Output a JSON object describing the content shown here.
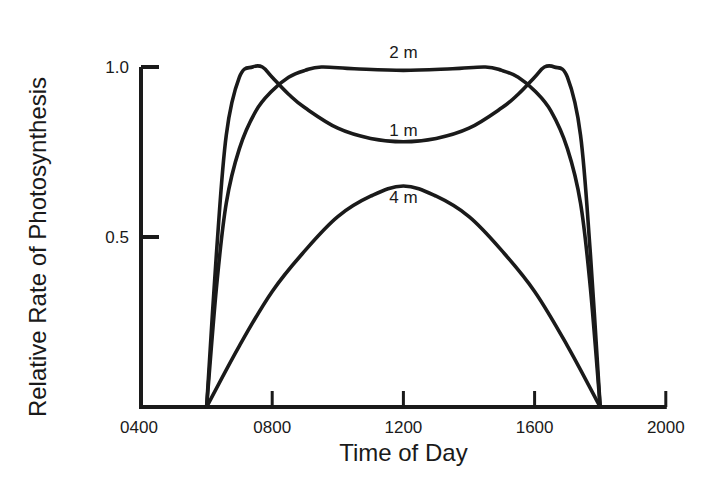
{
  "chart_data": {
    "type": "line",
    "title": "",
    "xlabel": "Time of Day",
    "ylabel": "Relative Rate of Photosynthesis",
    "x_tick_labels": [
      "0400",
      "0800",
      "1200",
      "1600",
      "2000"
    ],
    "x_ticks_hours": [
      4,
      8,
      12,
      16,
      20
    ],
    "y_tick_labels": [
      "0.5",
      "1.0"
    ],
    "y_ticks": [
      0.5,
      1.0
    ],
    "xlim_hours": [
      4,
      20
    ],
    "ylim": [
      0,
      1.0
    ],
    "grid": false,
    "legend": "inline labels on curves",
    "series": [
      {
        "name": "1 m",
        "label": "1 m",
        "x_hours": [
          6.0,
          6.3,
          6.6,
          7.0,
          7.4,
          7.7,
          8.0,
          8.5,
          9.0,
          10.0,
          11.0,
          12.0,
          13.0,
          14.0,
          15.0,
          15.5,
          16.0,
          16.3,
          16.6,
          17.0,
          17.4,
          17.7,
          18.0
        ],
        "values": [
          0.0,
          0.45,
          0.8,
          0.97,
          1.0,
          1.0,
          0.97,
          0.92,
          0.88,
          0.82,
          0.79,
          0.78,
          0.79,
          0.82,
          0.88,
          0.92,
          0.97,
          1.0,
          1.0,
          0.97,
          0.8,
          0.45,
          0.0
        ]
      },
      {
        "name": "2 m",
        "label": "2 m",
        "x_hours": [
          6.0,
          6.3,
          6.6,
          7.0,
          7.5,
          8.0,
          8.5,
          9.0,
          9.5,
          10.5,
          12.0,
          13.5,
          14.5,
          15.0,
          15.5,
          16.0,
          16.5,
          17.0,
          17.4,
          17.7,
          18.0
        ],
        "values": [
          0.0,
          0.35,
          0.6,
          0.76,
          0.87,
          0.93,
          0.97,
          0.99,
          1.0,
          0.995,
          0.99,
          0.995,
          1.0,
          0.99,
          0.97,
          0.93,
          0.87,
          0.76,
          0.6,
          0.35,
          0.0
        ]
      },
      {
        "name": "4 m",
        "label": "4 m",
        "x_hours": [
          6.0,
          7.0,
          8.0,
          9.0,
          10.0,
          11.0,
          12.0,
          13.0,
          14.0,
          15.0,
          16.0,
          17.0,
          18.0
        ],
        "values": [
          0.0,
          0.18,
          0.34,
          0.46,
          0.56,
          0.62,
          0.65,
          0.62,
          0.56,
          0.46,
          0.34,
          0.18,
          0.0
        ]
      }
    ]
  },
  "colors": {
    "line": "#1a1a1a",
    "background": "#ffffff"
  }
}
